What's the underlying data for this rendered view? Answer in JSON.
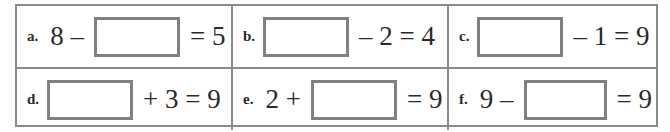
{
  "worksheet": {
    "problems": [
      {
        "label": "a.",
        "before": "8 –",
        "after": "= 5"
      },
      {
        "label": "b.",
        "before": "",
        "after": "– 2 = 4"
      },
      {
        "label": "c.",
        "before": "",
        "after": "– 1 = 9"
      },
      {
        "label": "d.",
        "before": "",
        "after": "+ 3 = 9"
      },
      {
        "label": "e.",
        "before": "2 +",
        "after": "= 9"
      },
      {
        "label": "f.",
        "before": "9 –",
        "after": "= 9"
      }
    ],
    "colors": {
      "border": "#8a8a8a",
      "answer_box": "#808080",
      "text": "#2a2a2a"
    }
  }
}
